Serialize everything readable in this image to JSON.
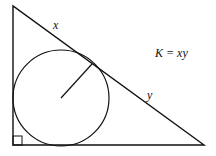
{
  "diagram": {
    "labels": {
      "hyp_upper": "x",
      "hyp_lower": "y",
      "formula": "K = xy"
    },
    "right_angle_marker": true,
    "colors": {
      "stroke": "#111111",
      "background": "#ffffff"
    }
  }
}
